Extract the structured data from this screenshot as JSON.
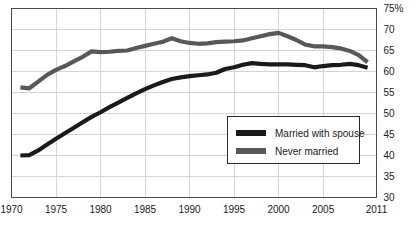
{
  "chart_data": {
    "type": "line",
    "title": "",
    "subtitle": "",
    "xlabel": "",
    "ylabel": "",
    "xlim": [
      1970,
      2011
    ],
    "ylim": [
      30,
      75
    ],
    "grid": true,
    "legend_position": "inside-bottom-right",
    "y_ticks": [
      30,
      35,
      40,
      45,
      50,
      55,
      60,
      65,
      70,
      75
    ],
    "y_tick_labels": [
      "30",
      "35",
      "40",
      "45",
      "50",
      "55",
      "60",
      "65",
      "70",
      "75%"
    ],
    "x_ticks": [
      1970,
      1975,
      1980,
      1985,
      1990,
      1995,
      2000,
      2005,
      2011
    ],
    "x_tick_labels": [
      "1970",
      "1975",
      "1980",
      "1985",
      "1990",
      "1995",
      "2000",
      "2005",
      "2011"
    ],
    "series": [
      {
        "name": "Married with spouse",
        "color": "#1a1a1a",
        "x": [
          1971,
          1972,
          1973,
          1974,
          1975,
          1976,
          1977,
          1978,
          1979,
          1980,
          1981,
          1982,
          1983,
          1984,
          1985,
          1986,
          1987,
          1988,
          1989,
          1990,
          1991,
          1992,
          1993,
          1994,
          1995,
          1996,
          1997,
          1998,
          1999,
          2000,
          2001,
          2002,
          2003,
          2004,
          2005,
          2006,
          2007,
          2008,
          2009,
          2010
        ],
        "values": [
          40.0,
          40.1,
          41.2,
          42.6,
          44.0,
          45.3,
          46.6,
          47.9,
          49.2,
          50.3,
          51.5,
          52.6,
          53.7,
          54.8,
          55.8,
          56.7,
          57.5,
          58.2,
          58.6,
          58.9,
          59.1,
          59.3,
          59.7,
          60.6,
          61.0,
          61.6,
          62.0,
          61.8,
          61.7,
          61.7,
          61.7,
          61.6,
          61.5,
          61.0,
          61.3,
          61.5,
          61.6,
          61.8,
          61.5,
          60.9
        ]
      },
      {
        "name": "Never married",
        "color": "#585858",
        "x": [
          1971,
          1972,
          1973,
          1974,
          1975,
          1976,
          1977,
          1978,
          1979,
          1980,
          1981,
          1982,
          1983,
          1984,
          1985,
          1986,
          1987,
          1988,
          1989,
          1990,
          1991,
          1992,
          1993,
          1994,
          1995,
          1996,
          1997,
          1998,
          1999,
          2000,
          2001,
          2002,
          2003,
          2004,
          2005,
          2006,
          2007,
          2008,
          2009,
          2010
        ],
        "values": [
          56.2,
          56.0,
          57.6,
          59.2,
          60.4,
          61.3,
          62.4,
          63.5,
          64.8,
          64.6,
          64.7,
          64.9,
          65.0,
          65.6,
          66.1,
          66.6,
          67.1,
          67.9,
          67.2,
          66.8,
          66.6,
          66.7,
          67.0,
          67.1,
          67.2,
          67.4,
          67.9,
          68.4,
          68.9,
          69.2,
          68.4,
          67.5,
          66.4,
          66.0,
          66.0,
          65.8,
          65.5,
          64.9,
          63.9,
          62.2
        ]
      }
    ],
    "annotations": []
  },
  "legend": {
    "items": [
      {
        "label": "Married with spouse",
        "color": "#1a1a1a"
      },
      {
        "label": "Never married",
        "color": "#585858"
      }
    ]
  },
  "colors": {
    "axis": "#4a4a4a",
    "grid": "#d4d4d4",
    "text": "#1a1a1a",
    "background": "#ffffff",
    "series_married": "#1a1a1a",
    "series_never_married": "#585858"
  }
}
